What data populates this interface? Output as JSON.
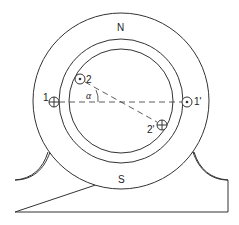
{
  "diagram": {
    "title": "",
    "labels": {
      "north_pole": "N",
      "south_pole": "S",
      "coil1": "1",
      "coil1_prime": "1'",
      "coil2": "2",
      "coil2_prime": "2'",
      "angle": "α"
    },
    "colors": {
      "stroke": "#333333",
      "background": "#ffffff"
    },
    "symbols": {
      "coil1": "cross-in-circle",
      "coil1_prime": "dot-in-circle",
      "coil2": "dot-in-circle",
      "coil2_prime": "cross-in-circle"
    }
  }
}
